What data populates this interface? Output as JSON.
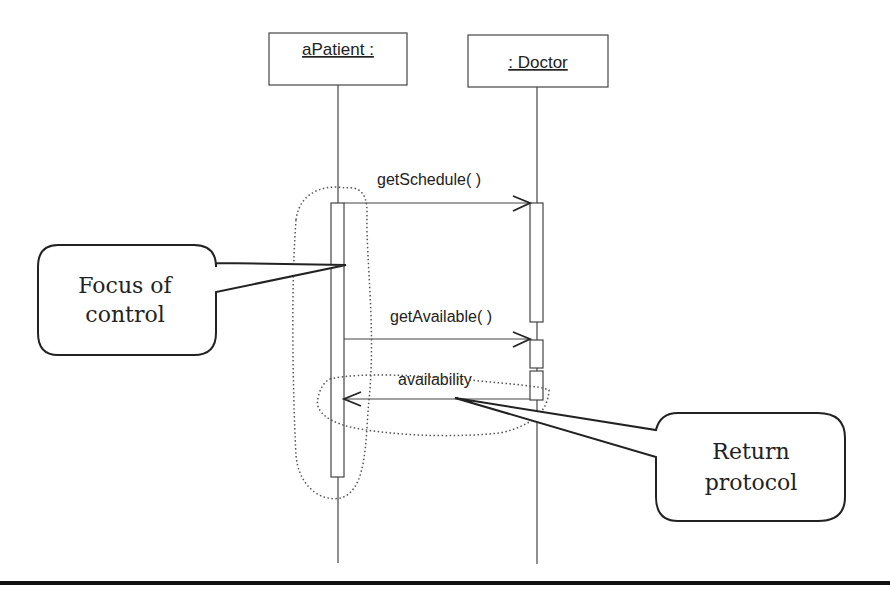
{
  "diagram": {
    "type": "UML sequence diagram",
    "lifelines": [
      {
        "label_line1": "aPatient :",
        "label_line2": "Patient"
      },
      {
        "label_line1": ": Doctor"
      }
    ],
    "messages": [
      {
        "label": "getSchedule( )",
        "from": "aPatient : Patient",
        "to": ": Doctor",
        "kind": "call"
      },
      {
        "label": "getAvailable( )",
        "from": "aPatient : Patient",
        "to": ": Doctor",
        "kind": "call"
      },
      {
        "label": "availability",
        "from": ": Doctor",
        "to": "aPatient : Patient",
        "kind": "return"
      }
    ],
    "callouts": [
      {
        "line1": "Focus of",
        "line2": "control"
      },
      {
        "line1": "Return",
        "line2": "protocol"
      }
    ],
    "colors": {
      "line": "#333333",
      "text": "#222222",
      "dotted": "#555555",
      "rule": "#111111"
    }
  }
}
